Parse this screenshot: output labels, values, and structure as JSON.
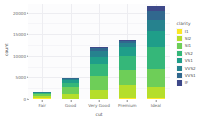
{
  "chart_data": {
    "type": "bar",
    "stacked": true,
    "title": "",
    "subtitle": "",
    "xlabel": "cut",
    "ylabel": "count",
    "categories": [
      "Fair",
      "Good",
      "Very Good",
      "Premium",
      "Ideal"
    ],
    "ylim": [
      0,
      22000
    ],
    "y_ticks": [
      0,
      5000,
      10000,
      15000,
      20000
    ],
    "y_tick_labels": [
      "0",
      "5000",
      "10000",
      "15000",
      "20000"
    ],
    "grid": true,
    "legend": {
      "title": "clarity",
      "position": "right",
      "entries": [
        {
          "label": "I1",
          "color": "#fde725"
        },
        {
          "label": "SI2",
          "color": "#b5de2b"
        },
        {
          "label": "SI1",
          "color": "#6ece58"
        },
        {
          "label": "VS2",
          "color": "#35b779"
        },
        {
          "label": "VS1",
          "color": "#1f9e89"
        },
        {
          "label": "VVS2",
          "color": "#26828e"
        },
        {
          "label": "VVS1",
          "color": "#31688e"
        },
        {
          "label": "IF",
          "color": "#3e4989"
        }
      ]
    },
    "series": [
      {
        "name": "I1",
        "color": "#fde725",
        "values": [
          210,
          96,
          84,
          205,
          146
        ]
      },
      {
        "name": "SI2",
        "color": "#b5de2b",
        "values": [
          466,
          1081,
          2100,
          2949,
          2598
        ]
      },
      {
        "name": "SI1",
        "color": "#6ece58",
        "values": [
          408,
          1560,
          3240,
          3575,
          4282
        ]
      },
      {
        "name": "VS2",
        "color": "#35b779",
        "values": [
          261,
          978,
          2591,
          3357,
          5071
        ]
      },
      {
        "name": "VS1",
        "color": "#1f9e89",
        "values": [
          170,
          648,
          1775,
          1989,
          3589
        ]
      },
      {
        "name": "VVS2",
        "color": "#26828e",
        "values": [
          69,
          286,
          1235,
          870,
          2606
        ]
      },
      {
        "name": "VVS1",
        "color": "#31688e",
        "values": [
          17,
          186,
          789,
          616,
          2047
        ]
      },
      {
        "name": "IF",
        "color": "#3e4989",
        "values": [
          9,
          71,
          268,
          230,
          1212
        ]
      }
    ],
    "totals": [
      1610,
      4906,
      12082,
      13791,
      21551
    ]
  },
  "style": {
    "panel_background": "#fcfcfd",
    "grid_major_color": "#ededf1",
    "grid_minor_color": "#f5f5f8",
    "axis_text_color": "#6b6b6b",
    "axis_title_color": "#4d4d4d",
    "plot_background": "#ffffff"
  }
}
